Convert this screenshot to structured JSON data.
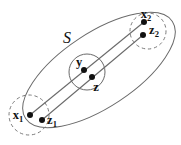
{
  "diagram": {
    "set_label": "S",
    "colors": {
      "background": "#ffffff",
      "outline": "#6a6a6a",
      "dashed_outline": "#7b7b7b",
      "dot": "#111111",
      "text": "#111111"
    },
    "points": {
      "x1": {
        "base": "x",
        "sub": "1",
        "x": 30,
        "y": 115,
        "label_x": 18,
        "label_y": 119
      },
      "z1": {
        "base": "z",
        "sub": "1",
        "x": 42,
        "y": 120,
        "label_x": 52,
        "label_y": 124
      },
      "y": {
        "base": "y",
        "sub": "",
        "x": 84,
        "y": 70,
        "label_x": 79,
        "label_y": 66
      },
      "z": {
        "base": "z",
        "sub": "",
        "x": 92,
        "y": 77,
        "label_x": 96,
        "label_y": 91
      },
      "x2": {
        "base": "x",
        "sub": "2",
        "x": 144,
        "y": 22,
        "label_x": 146,
        "label_y": 18
      },
      "z2": {
        "base": "z",
        "sub": "2",
        "x": 143,
        "y": 35,
        "label_x": 154,
        "label_y": 34
      }
    },
    "segments": [
      {
        "from": "x1",
        "to": "x2"
      },
      {
        "from": "z1",
        "to": "z2"
      }
    ],
    "regions": {
      "set_ellipse": {
        "cx": 99,
        "cy": 70,
        "rx": 88,
        "ry": 37,
        "rotation_deg": -33.5,
        "transform": "rotate(-33.5 99 70)",
        "style": "solid"
      },
      "neighborhood_x1": {
        "cx": 29,
        "cy": 115,
        "r": 20,
        "style": "dashed"
      },
      "neighborhood_x2": {
        "cx": 148,
        "cy": 31,
        "r": 18,
        "style": "dashed"
      },
      "neighborhood_y": {
        "cx": 87,
        "cy": 72,
        "r": 18,
        "style": "solid"
      }
    },
    "set_label_pos": {
      "x": 67,
      "y": 43
    },
    "dot_radius": 3
  }
}
